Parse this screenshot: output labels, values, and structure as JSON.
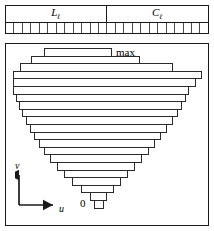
{
  "top_panel": {
    "segments": [
      {
        "label": "L",
        "subscript": "ℓ",
        "width_fraction": 0.495,
        "name": "segment-l"
      },
      {
        "label": "C",
        "subscript": "ℓ",
        "width_fraction": 0.505,
        "name": "segment-c"
      }
    ],
    "cell_strip": {
      "cell_count": 24,
      "description": "row of small square cells"
    }
  },
  "bottom_panel": {
    "max_label": "max",
    "zero_label": "0",
    "axes": {
      "vertical_label": "v",
      "horizontal_label": "u"
    }
  },
  "chart_data": {
    "type": "bar",
    "orientation": "horizontal",
    "title": "",
    "xlabel": "u",
    "ylabel": "v",
    "annotations": [
      "max",
      "0"
    ],
    "grid": false,
    "legend": null,
    "bar_height": 7.6,
    "xlim": [
      0,
      204
    ],
    "bars": [
      {
        "index": 0,
        "left": 38,
        "right": 106,
        "width": 68
      },
      {
        "index": 1,
        "left": 25,
        "right": 134,
        "width": 109
      },
      {
        "index": 2,
        "left": 14,
        "right": 167,
        "width": 153
      },
      {
        "index": 3,
        "left": 7,
        "right": 196,
        "width": 189
      },
      {
        "index": 4,
        "left": 7,
        "right": 190,
        "width": 183
      },
      {
        "index": 5,
        "left": 7,
        "right": 183,
        "width": 176
      },
      {
        "index": 6,
        "left": 10,
        "right": 180,
        "width": 170
      },
      {
        "index": 7,
        "left": 13,
        "right": 176,
        "width": 163
      },
      {
        "index": 8,
        "left": 16,
        "right": 172,
        "width": 156
      },
      {
        "index": 9,
        "left": 20,
        "right": 167,
        "width": 147
      },
      {
        "index": 10,
        "left": 24,
        "right": 161,
        "width": 137
      },
      {
        "index": 11,
        "left": 28,
        "right": 155,
        "width": 127
      },
      {
        "index": 12,
        "left": 33,
        "right": 149,
        "width": 116
      },
      {
        "index": 13,
        "left": 38,
        "right": 143,
        "width": 105
      },
      {
        "index": 14,
        "left": 44,
        "right": 136,
        "width": 92
      },
      {
        "index": 15,
        "left": 51,
        "right": 129,
        "width": 78
      },
      {
        "index": 16,
        "left": 58,
        "right": 122,
        "width": 64
      },
      {
        "index": 17,
        "left": 66,
        "right": 115,
        "width": 49
      },
      {
        "index": 18,
        "left": 75,
        "right": 108,
        "width": 33
      },
      {
        "index": 19,
        "left": 84,
        "right": 101,
        "width": 17
      },
      {
        "index": 20,
        "left": 88,
        "right": 98,
        "width": 10
      }
    ]
  }
}
